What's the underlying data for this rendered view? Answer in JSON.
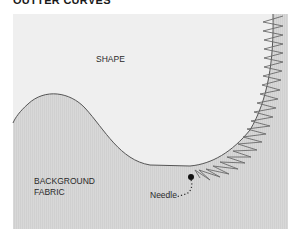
{
  "header": {
    "title": "OUTTER CURVES"
  },
  "labels": {
    "shape": "SHAPE",
    "background_line1": "BACKGROUND",
    "background_line2": "FABRIC",
    "needle": "Needle"
  },
  "colors": {
    "shape_fill": "#efefef",
    "background_fabric_fill": "#d6d6d6",
    "outline": "#555555",
    "stitch": "#6a6a6a",
    "needle": "#111111"
  }
}
